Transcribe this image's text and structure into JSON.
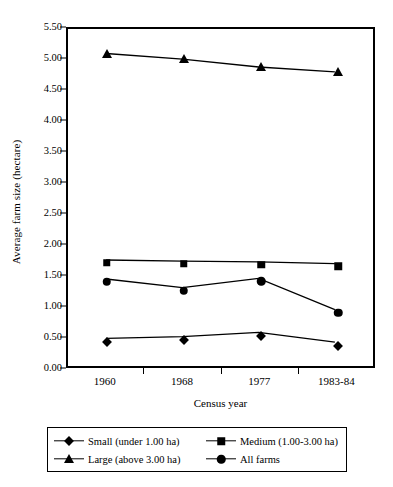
{
  "chart_data": {
    "type": "line",
    "title": "",
    "xlabel": "Census year",
    "ylabel": "Average farm size (hectare)",
    "categories": [
      "1960",
      "1968",
      "1977",
      "1983-84"
    ],
    "ylim": [
      0.0,
      5.5
    ],
    "yticks": [
      "0.00",
      "0.50",
      "1.00",
      "1.50",
      "2.00",
      "2.50",
      "3.00",
      "3.50",
      "4.00",
      "4.50",
      "5.00",
      "5.50"
    ],
    "ytick_values": [
      0.0,
      0.5,
      1.0,
      1.5,
      2.0,
      2.5,
      3.0,
      3.5,
      4.0,
      4.5,
      5.0,
      5.5
    ],
    "grid": false,
    "legend_position": "bottom",
    "series": [
      {
        "name": "Small (under 1.00 ha)",
        "marker": "diamond",
        "color": "#000000",
        "values": [
          0.45,
          0.48,
          0.55,
          0.39
        ]
      },
      {
        "name": "Medium (1.00-3.00 ha)",
        "marker": "square",
        "color": "#000000",
        "values": [
          1.73,
          1.71,
          1.7,
          1.67
        ]
      },
      {
        "name": "Large (above 3.00 ha)",
        "marker": "triangle",
        "color": "#000000",
        "values": [
          5.1,
          5.01,
          4.88,
          4.8
        ]
      },
      {
        "name": "All farms",
        "marker": "circle",
        "color": "#000000",
        "values": [
          1.42,
          1.28,
          1.43,
          0.92
        ]
      }
    ]
  }
}
